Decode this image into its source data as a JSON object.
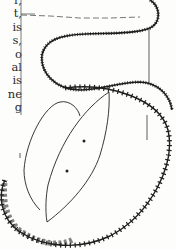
{
  "page": {
    "text_fragments": [
      "r,",
      "t,",
      "is",
      "s,",
      "o",
      "al",
      "is",
      "ne",
      "g"
    ]
  },
  "illustration": {
    "description": "Line drawing of a specimen: a coiled beaded/toothed band forming a loop at top and a large oval rim at bottom, enclosing a leaf-shaped lobe with two dots",
    "stroke_color": "#1e1e1e",
    "background_color": "#fdfdfc"
  }
}
